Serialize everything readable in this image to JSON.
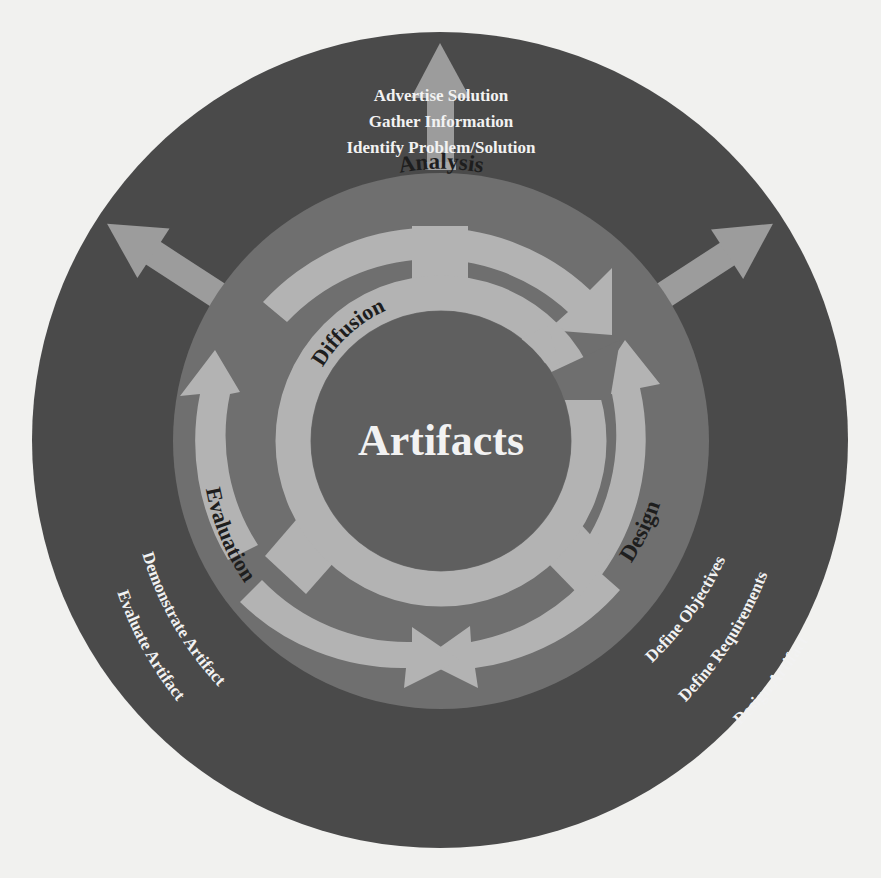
{
  "diagram": {
    "center_label": "Artifacts",
    "phases": {
      "analysis": "Analysis",
      "design": "Design",
      "evaluation": "Evaluation",
      "diffusion": "Diffusion"
    },
    "outputs": {
      "top": [
        "Advertise Solution",
        "Gather Information",
        "Identify Problem/Solution"
      ],
      "lower_left": [
        "Demonstrate Artifact",
        "Evaluate Artifact"
      ],
      "lower_right": [
        "Define Objectives",
        "Define Requirements",
        "Design Artifact"
      ]
    },
    "colors": {
      "background": "#f1f1ef",
      "outer_disc": "#4a4a4a",
      "middle_ring": "#6f6f6f",
      "inner_dark": "#5f5f5f",
      "light_band": "#b2b2b2",
      "arrow_out": "#9a9a9a",
      "label_dark": "#1e1e1e",
      "label_light": "#f2f2f2"
    }
  }
}
